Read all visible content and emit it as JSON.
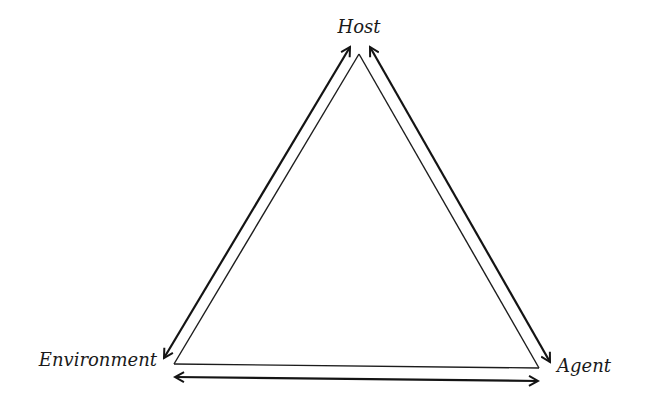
{
  "diagram": {
    "type": "epidemiological-triangle",
    "nodes": {
      "top": {
        "label": "Host"
      },
      "left": {
        "label": "Environment"
      },
      "right": {
        "label": "Agent"
      }
    },
    "edges": [
      {
        "from": "Host",
        "to": "Environment",
        "direction": "bidirectional"
      },
      {
        "from": "Host",
        "to": "Agent",
        "direction": "bidirectional"
      },
      {
        "from": "Environment",
        "to": "Agent",
        "direction": "bidirectional"
      }
    ],
    "colors": {
      "background": "#ffffff",
      "lines": "#1a1a1a",
      "text": "#1a1a1a"
    }
  }
}
